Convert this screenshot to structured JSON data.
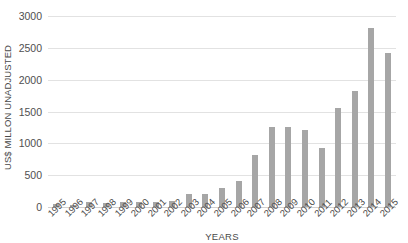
{
  "chart_data": {
    "type": "bar",
    "title": "",
    "xlabel": "YEARS",
    "ylabel": "US$ MILLON UNADJUSTED",
    "ylim": [
      0,
      3000
    ],
    "ytick_step": 500,
    "yticks": [
      "3000",
      "2500",
      "2000",
      "1500",
      "1000",
      "500",
      "0"
    ],
    "grid": true,
    "legend": "none",
    "bar_color": "#a6a6a6",
    "gridline_color": "#e2e2e2",
    "background_color": "#ffffff",
    "categories": [
      "1995",
      "1996",
      "1997",
      "1998",
      "1999",
      "2000",
      "2001",
      "2002",
      "2003",
      "2004",
      "2005",
      "2006",
      "2007",
      "2008",
      "2009",
      "2010",
      "2011",
      "2012",
      "2013",
      "2014",
      "2015"
    ],
    "values": [
      40,
      30,
      75,
      70,
      80,
      80,
      85,
      90,
      210,
      210,
      305,
      410,
      810,
      1255,
      1255,
      1210,
      920,
      1555,
      1815,
      2810,
      2415
    ]
  }
}
